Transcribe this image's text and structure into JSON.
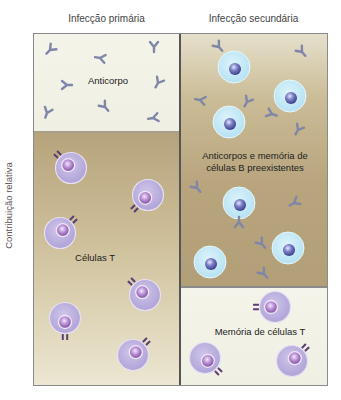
{
  "columns": {
    "primary": "Infecção primária",
    "secondary": "Infecção secundária"
  },
  "y_axis_label": "Contribuição relativa",
  "panels": {
    "primary_antibody": {
      "label": "Anticorpo"
    },
    "primary_tcells": {
      "label": "Células T"
    },
    "secondary_antibody_bmemory": {
      "label_line1": "Anticorpos e memória de",
      "label_line2": "células B preexistentes"
    },
    "secondary_tmemory": {
      "label": "Memória de células T"
    }
  },
  "colors": {
    "antibody": "#7f86a8",
    "b_cell_body": "#c6e9f5",
    "b_cell_nucleus": "#6a6fb5",
    "t_cell_body": "#b9addb",
    "t_cell_nucleus": "#9a72b8",
    "t_receptor": "#5a3f70",
    "light_panel": "#f3f2e7",
    "tan_panel": "#bda982"
  },
  "elements": {
    "primary_antibodies": [
      [
        50,
        50,
        45
      ],
      [
        100,
        58,
        100
      ],
      [
        154,
        47,
        0
      ],
      [
        67,
        85,
        -90
      ],
      [
        158,
        83,
        30
      ],
      [
        47,
        113,
        20
      ],
      [
        105,
        107,
        -40
      ],
      [
        153,
        118,
        80
      ]
    ],
    "primary_tcells": [
      [
        71,
        168,
        -45
      ],
      [
        148,
        195,
        -135
      ],
      [
        60,
        233,
        45
      ],
      [
        145,
        295,
        -45
      ],
      [
        65,
        318,
        180
      ],
      [
        133,
        355,
        45
      ]
    ],
    "secondary_bcells": [
      [
        234,
        67
      ],
      [
        290,
        96
      ],
      [
        229,
        122
      ],
      [
        239,
        203
      ],
      [
        210,
        262
      ],
      [
        288,
        248
      ]
    ],
    "secondary_antibodies": [
      [
        219,
        47,
        -40
      ],
      [
        302,
        52,
        -40
      ],
      [
        200,
        100,
        100
      ],
      [
        247,
        102,
        30
      ],
      [
        272,
        114,
        -70
      ],
      [
        298,
        130,
        30
      ],
      [
        197,
        188,
        -40
      ],
      [
        294,
        203,
        60
      ],
      [
        239,
        222,
        180
      ],
      [
        262,
        244,
        -40
      ],
      [
        264,
        274,
        -40
      ]
    ],
    "secondary_tmemory": [
      [
        275,
        307,
        -90
      ],
      [
        205,
        358,
        135
      ],
      [
        292,
        361,
        45
      ]
    ]
  }
}
